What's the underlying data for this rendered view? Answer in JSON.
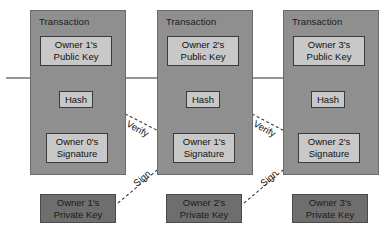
{
  "diagram": {
    "colors": {
      "page_background": "#ffffff",
      "transaction_fill": "#8f8f8f",
      "transaction_stroke": "#6b6b6b",
      "inner_box_fill": "#c8c8c8",
      "inner_box_stroke": "#3a3a3a",
      "private_key_fill": "#6e6e6e",
      "private_key_stroke": "#4a4a4a",
      "solid_line": "#2b2b2b",
      "dashed_line": "#3a3a3a",
      "text": "#111111"
    },
    "transactions": [
      {
        "title": "Transaction",
        "public_key": {
          "line1": "Owner 1's",
          "line2": "Public Key"
        },
        "hash": "Hash",
        "signature": {
          "line1": "Owner 0's",
          "line2": "Signature"
        }
      },
      {
        "title": "Transaction",
        "public_key": {
          "line1": "Owner 2's",
          "line2": "Public Key"
        },
        "hash": "Hash",
        "signature": {
          "line1": "Owner 1's",
          "line2": "Signature"
        }
      },
      {
        "title": "Transaction",
        "public_key": {
          "line1": "Owner 3's",
          "line2": "Public Key"
        },
        "hash": "Hash",
        "signature": {
          "line1": "Owner 2's",
          "line2": "Signature"
        }
      }
    ],
    "private_keys": [
      {
        "line1": "Owner 1's",
        "line2": "Private Key"
      },
      {
        "line1": "Owner 2's",
        "line2": "Private Key"
      },
      {
        "line1": "Owner 3's",
        "line2": "Private Key"
      }
    ],
    "edge_labels": {
      "verify": "Verify",
      "sign": "Sign"
    }
  }
}
